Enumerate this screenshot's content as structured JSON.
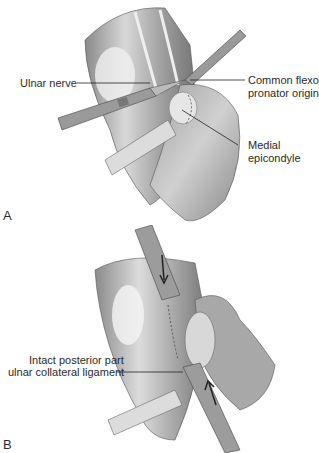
{
  "figure": {
    "panels": [
      {
        "letter": "A",
        "labels": {
          "ulnar_nerve": "Ulnar nerve",
          "common_flexor_line1": "Common flexor",
          "common_flexor_line2": "pronator origin",
          "medial_line1": "Medial",
          "medial_line2": "epicondyle"
        }
      },
      {
        "letter": "B",
        "labels": {
          "intact_line1": "Intact posterior part",
          "intact_line2": "ulnar collateral ligament"
        }
      }
    ]
  }
}
